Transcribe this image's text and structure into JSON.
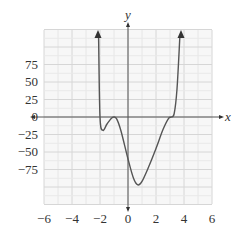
{
  "chart_data": {
    "type": "line",
    "title": "",
    "xlabel": "x",
    "ylabel": "y",
    "xlim": [
      -6,
      6
    ],
    "ylim": [
      -125,
      125
    ],
    "grid": true,
    "x_ticks": [
      -6,
      -4,
      -2,
      0,
      2,
      4,
      6
    ],
    "x_tick_labels": [
      "−6",
      "−4",
      "−2",
      "0",
      "2",
      "4",
      "6"
    ],
    "y_ticks": [
      75,
      50,
      25,
      0,
      -25,
      -50,
      -75
    ],
    "y_tick_labels": [
      "75",
      "50",
      "25",
      "0",
      "−25",
      "−50",
      "−75"
    ],
    "series": [
      {
        "name": "f(x)",
        "description": "Polynomial curve with arrows at both ends pointing upward",
        "x": [
          -2.1,
          -2.0,
          -1.8,
          -1.5,
          -1.2,
          -1.0,
          -0.8,
          -0.5,
          0.0,
          0.4,
          0.7,
          1.0,
          1.5,
          2.0,
          2.5,
          2.9,
          3.1,
          3.3,
          3.5,
          3.7
        ],
        "y": [
          120,
          0,
          -19,
          -10,
          -2,
          0,
          -3,
          -20,
          -60,
          -88,
          -97,
          -92,
          -70,
          -45,
          -18,
          -2,
          0,
          5,
          40,
          120
        ]
      }
    ],
    "key_points": {
      "left_local_min": [
        -1.8,
        -19
      ],
      "local_max": [
        -1.0,
        0
      ],
      "global_min": [
        0.7,
        -97
      ],
      "right_flat_zero": [
        3.0,
        0
      ]
    },
    "colors": {
      "curve": "#555555",
      "axes": "#555555",
      "grid": "#dddddd",
      "text": "#333333"
    }
  }
}
